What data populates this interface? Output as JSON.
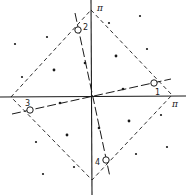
{
  "figure": {
    "axis_labels": {
      "x_end": "π",
      "y_end": "π"
    },
    "points": {
      "labels": [
        "1",
        "2",
        "3",
        "4"
      ]
    }
  }
}
